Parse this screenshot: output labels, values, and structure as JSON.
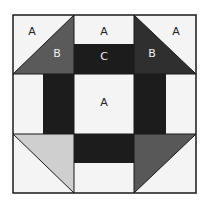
{
  "diagram": {
    "colors": {
      "background": "#f4f4f4",
      "light": "#f4f4f4",
      "dark_c": "#1c1c1c",
      "tl_b": "#5a5a5a",
      "tr_b": "#2f2f2f",
      "bl_tri": "#cfcfcf",
      "br_tri": "#585858",
      "outline": "#1a1a1a"
    },
    "labels": {
      "tl_a": "A",
      "tl_b": "B",
      "top_a": "A",
      "top_c": "C",
      "tr_b": "B",
      "tr_a": "A",
      "center_a": "A"
    }
  }
}
